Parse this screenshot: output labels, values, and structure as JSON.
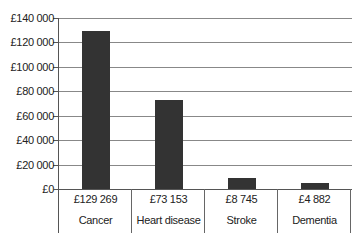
{
  "chart_data": {
    "type": "bar",
    "title": "",
    "xlabel": "",
    "ylabel": "",
    "categories": [
      "Cancer",
      "Heart disease",
      "Stroke",
      "Dementia"
    ],
    "values": [
      129269,
      73153,
      8745,
      4882
    ],
    "value_labels": [
      "£129 269",
      "£73 153",
      "£8 745",
      "£4 882"
    ],
    "ylim": [
      0,
      140000
    ],
    "yticks": [
      0,
      20000,
      40000,
      60000,
      80000,
      100000,
      120000,
      140000
    ],
    "ytick_labels": [
      "£0",
      "£20 000",
      "£40 000",
      "£60 000",
      "£80 000",
      "£100 000",
      "£120 000",
      "£140 000"
    ],
    "grid": true,
    "legend": null,
    "data_table_below": true,
    "bar_color": "#333333"
  }
}
